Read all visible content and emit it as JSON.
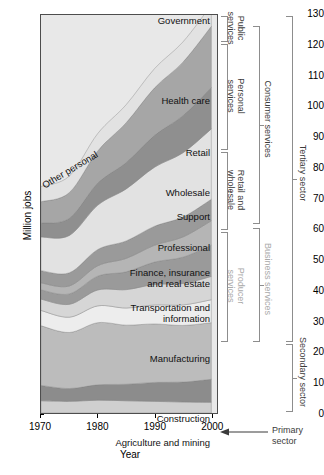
{
  "chart": {
    "type": "area",
    "title": "",
    "xlabel": "Year",
    "ylabel": "Million jobs",
    "xlim": [
      1970,
      2001
    ],
    "ylim": [
      0,
      130
    ],
    "yticks": [
      0,
      10,
      20,
      30,
      40,
      50,
      60,
      70,
      80,
      90,
      100,
      110,
      120,
      130
    ],
    "xticks": [
      1970,
      1980,
      1990,
      2000
    ],
    "grid": false,
    "legend_position": "inline-labels"
  },
  "chart_data": {
    "type": "area",
    "xlabel": "Year",
    "ylabel": "Million jobs",
    "xlim": [
      1970,
      2001
    ],
    "ylim": [
      0,
      130
    ],
    "yticks": [
      0,
      10,
      20,
      30,
      40,
      50,
      60,
      70,
      80,
      90,
      100,
      110,
      120,
      130
    ],
    "xticks": [
      1970,
      1980,
      1990,
      2000
    ],
    "grid": false,
    "stacked": true,
    "x": [
      1970,
      1975,
      1980,
      1985,
      1990,
      1995,
      2000
    ],
    "series": [
      {
        "name": "Agriculture and mining",
        "color": "#cfcfcf",
        "values": [
          4.0,
          3.8,
          4.2,
          4.0,
          3.8,
          3.6,
          3.5
        ]
      },
      {
        "name": "Construction",
        "color": "#8c8c8c",
        "values": [
          5.0,
          4.2,
          5.0,
          5.4,
          6.2,
          6.5,
          7.5
        ]
      },
      {
        "name": "Manufacturing",
        "color": "#bcbcbc",
        "values": [
          19.5,
          18.3,
          20.3,
          19.3,
          19.1,
          18.5,
          18.5
        ]
      },
      {
        "name": "Transportation and information",
        "color": "#ededed",
        "values": [
          5.0,
          5.0,
          5.5,
          5.6,
          6.2,
          6.7,
          7.5
        ]
      },
      {
        "name": "Finance, insurance and real estate",
        "color": "#d6d6d6",
        "values": [
          3.7,
          4.2,
          5.2,
          6.0,
          6.7,
          7.0,
          7.6
        ]
      },
      {
        "name": "Professional",
        "color": "#9a9a9a",
        "values": [
          3.0,
          3.4,
          4.5,
          5.8,
          7.3,
          8.6,
          10.2
        ]
      },
      {
        "name": "Support",
        "color": "#b5b5b5",
        "values": [
          2.3,
          2.6,
          3.4,
          4.4,
          5.5,
          6.6,
          8.0
        ]
      },
      {
        "name": "Wholesale",
        "color": "#9a9a9a",
        "values": [
          4.0,
          4.3,
          5.3,
          5.7,
          6.2,
          6.5,
          7.0
        ]
      },
      {
        "name": "Retail",
        "color": "#e2e2e2",
        "values": [
          11.0,
          12.2,
          14.5,
          17.0,
          19.3,
          21.0,
          23.0
        ]
      },
      {
        "name": "Health care",
        "color": "#8f8f8f",
        "values": [
          4.5,
          5.6,
          7.2,
          8.6,
          10.4,
          12.1,
          13.5
        ]
      },
      {
        "name": "Other personal",
        "color": "#a6a6a6",
        "values": [
          7.0,
          8.4,
          10.5,
          13.0,
          15.5,
          17.5,
          20.0
        ]
      },
      {
        "name": "Government",
        "color": "#e2e2e2",
        "values": [
          5.0,
          5.4,
          5.7,
          5.9,
          6.3,
          6.6,
          7.0
        ]
      }
    ],
    "totals": [
      74.0,
      77.4,
      91.3,
      100.7,
      112.5,
      121.2,
      133.3
    ],
    "annotations": [
      "Public services",
      "Personal services",
      "Retail and wholesale",
      "Producer services",
      "Consumer services",
      "Business services",
      "Tertiary sector",
      "Secondary sector",
      "Primary sector"
    ]
  },
  "band_labels": [
    {
      "text": "Government",
      "key": "government"
    },
    {
      "text": "Health care",
      "key": "health-care"
    },
    {
      "text": "Other personal",
      "key": "other-personal"
    },
    {
      "text": "Retail",
      "key": "retail"
    },
    {
      "text": "Wholesale",
      "key": "wholesale"
    },
    {
      "text": "Support",
      "key": "support"
    },
    {
      "text": "Professional",
      "key": "professional"
    },
    {
      "text": "Finance, insurance\nand real estate",
      "key": "finance"
    },
    {
      "text": "Transportation and\ninformation",
      "key": "transportation"
    },
    {
      "text": "Manufacturing",
      "key": "manufacturing"
    },
    {
      "text": "Construction",
      "key": "construction"
    },
    {
      "text": "Agriculture and mining",
      "key": "agriculture"
    }
  ],
  "brackets": {
    "level1": [
      {
        "text": "Public\nservices"
      },
      {
        "text": "Personal\nservices"
      },
      {
        "text": "Retail and\nwholesale"
      },
      {
        "text": "Producer\nservices"
      }
    ],
    "level2": [
      {
        "text": "Consumer services"
      },
      {
        "text": "Business services"
      }
    ],
    "level3": [
      {
        "text": "Tertiary sector"
      },
      {
        "text": "Secondary sector"
      }
    ],
    "primary": {
      "text": "Primary\nsector"
    }
  },
  "ticks": {
    "y": [
      "0",
      "10",
      "20",
      "30",
      "40",
      "50",
      "60",
      "70",
      "80",
      "90",
      "100",
      "110",
      "120",
      "130"
    ],
    "x": [
      "1970",
      "1980",
      "1990",
      "2000"
    ]
  },
  "axis": {
    "y_title": "Million jobs",
    "x_title": "Year"
  }
}
